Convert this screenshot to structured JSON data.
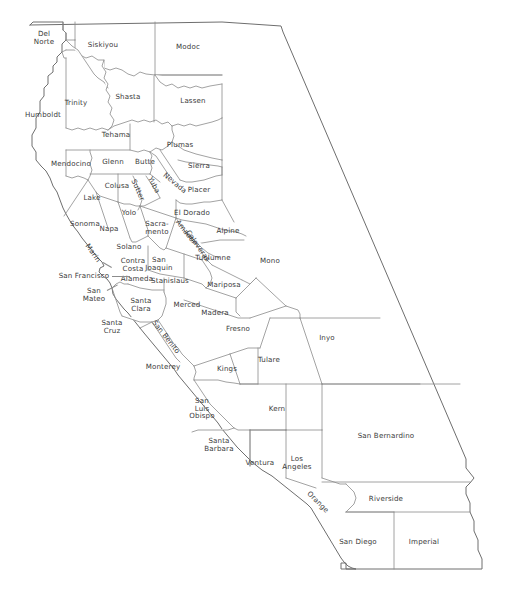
{
  "map": {
    "title": "California Counties",
    "region": "California",
    "style": {
      "background": "#ffffff",
      "border_color": "#8c8c8c",
      "outline_color": "#6e6e6e",
      "label_color": "#3b3b3b"
    },
    "county_count": 58,
    "counties": [
      {
        "name": "Del\nNorte",
        "x": 44,
        "y": 38,
        "rot": 0
      },
      {
        "name": "Siskiyou",
        "x": 103,
        "y": 45,
        "rot": 0
      },
      {
        "name": "Modoc",
        "x": 188,
        "y": 47,
        "rot": 0
      },
      {
        "name": "Humboldt",
        "x": 43,
        "y": 115,
        "rot": 0
      },
      {
        "name": "Trinity",
        "x": 76,
        "y": 103,
        "rot": 0
      },
      {
        "name": "Shasta",
        "x": 128,
        "y": 97,
        "rot": 0
      },
      {
        "name": "Lassen",
        "x": 193,
        "y": 101,
        "rot": 0
      },
      {
        "name": "Tehama",
        "x": 116,
        "y": 135,
        "rot": 0
      },
      {
        "name": "Plumas",
        "x": 180,
        "y": 145,
        "rot": 0
      },
      {
        "name": "Mendocino",
        "x": 71,
        "y": 164,
        "rot": 0
      },
      {
        "name": "Glenn",
        "x": 113,
        "y": 162,
        "rot": 0
      },
      {
        "name": "Butte",
        "x": 145,
        "y": 162,
        "rot": 0
      },
      {
        "name": "Sierra",
        "x": 199,
        "y": 166,
        "rot": 0
      },
      {
        "name": "Colusa",
        "x": 117,
        "y": 186,
        "rot": 0
      },
      {
        "name": "Sutter",
        "x": 138,
        "y": 190,
        "rot": 66
      },
      {
        "name": "Yuba",
        "x": 154,
        "y": 185,
        "rot": 62
      },
      {
        "name": "Nevada",
        "x": 175,
        "y": 183,
        "rot": 40
      },
      {
        "name": "Placer",
        "x": 199,
        "y": 190,
        "rot": 0
      },
      {
        "name": "Lake",
        "x": 92,
        "y": 198,
        "rot": 0
      },
      {
        "name": "Yolo",
        "x": 129,
        "y": 213,
        "rot": 0
      },
      {
        "name": "El Dorado",
        "x": 192,
        "y": 213,
        "rot": 0
      },
      {
        "name": "Sonoma",
        "x": 85,
        "y": 224,
        "rot": 0
      },
      {
        "name": "Napa",
        "x": 109,
        "y": 229,
        "rot": 0
      },
      {
        "name": "Sacra-\nmento",
        "x": 157,
        "y": 228,
        "rot": 0
      },
      {
        "name": "Amador",
        "x": 186,
        "y": 232,
        "rot": 52
      },
      {
        "name": "Alpine",
        "x": 228,
        "y": 231,
        "rot": 0
      },
      {
        "name": "Calaveras",
        "x": 198,
        "y": 246,
        "rot": 55
      },
      {
        "name": "Solano",
        "x": 129,
        "y": 247,
        "rot": 0
      },
      {
        "name": "Marin",
        "x": 93,
        "y": 253,
        "rot": 55
      },
      {
        "name": "Contra\nCosta",
        "x": 133,
        "y": 265,
        "rot": 0
      },
      {
        "name": "San\nJoaquin",
        "x": 159,
        "y": 264,
        "rot": 0
      },
      {
        "name": "Tuolumne",
        "x": 213,
        "y": 258,
        "rot": 0
      },
      {
        "name": "Mono",
        "x": 270,
        "y": 261,
        "rot": 0
      },
      {
        "name": "San Francisco",
        "x": 84,
        "y": 276,
        "rot": 0
      },
      {
        "name": "Alameda",
        "x": 137,
        "y": 279,
        "rot": 0
      },
      {
        "name": "Stanislaus",
        "x": 170,
        "y": 281,
        "rot": 0
      },
      {
        "name": "Mariposa",
        "x": 224,
        "y": 285,
        "rot": 0
      },
      {
        "name": "San\nMateo",
        "x": 94,
        "y": 295,
        "rot": 0
      },
      {
        "name": "Santa\nClara",
        "x": 141,
        "y": 305,
        "rot": 0
      },
      {
        "name": "Merced",
        "x": 187,
        "y": 305,
        "rot": 0
      },
      {
        "name": "Madera",
        "x": 215,
        "y": 313,
        "rot": 0
      },
      {
        "name": "Santa\nCruz",
        "x": 112,
        "y": 327,
        "rot": 0
      },
      {
        "name": "San Benito",
        "x": 166,
        "y": 337,
        "rot": 52
      },
      {
        "name": "Fresno",
        "x": 238,
        "y": 329,
        "rot": 0
      },
      {
        "name": "Inyo",
        "x": 327,
        "y": 338,
        "rot": 0
      },
      {
        "name": "Monterey",
        "x": 163,
        "y": 367,
        "rot": 0
      },
      {
        "name": "Kings",
        "x": 227,
        "y": 369,
        "rot": 0
      },
      {
        "name": "Tulare",
        "x": 269,
        "y": 360,
        "rot": 0
      },
      {
        "name": "San\nLuis\nObispo",
        "x": 202,
        "y": 408,
        "rot": 0
      },
      {
        "name": "Kern",
        "x": 277,
        "y": 409,
        "rot": 0
      },
      {
        "name": "Santa\nBarbara",
        "x": 219,
        "y": 445,
        "rot": 0
      },
      {
        "name": "Ventura",
        "x": 260,
        "y": 463,
        "rot": 0
      },
      {
        "name": "Los\nAngeles",
        "x": 297,
        "y": 463,
        "rot": 0
      },
      {
        "name": "San Bernardino",
        "x": 386,
        "y": 436,
        "rot": 0
      },
      {
        "name": "Orange",
        "x": 318,
        "y": 502,
        "rot": 45
      },
      {
        "name": "Riverside",
        "x": 386,
        "y": 499,
        "rot": 0
      },
      {
        "name": "San Diego",
        "x": 358,
        "y": 542,
        "rot": 0
      },
      {
        "name": "Imperial",
        "x": 424,
        "y": 542,
        "rot": 0
      }
    ]
  }
}
